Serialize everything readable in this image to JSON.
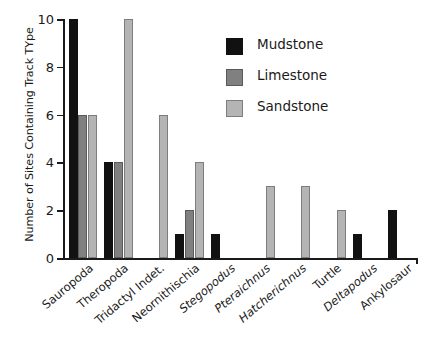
{
  "chart_data": {
    "type": "bar",
    "title": "",
    "xlabel": "",
    "ylabel": "Number of Sites Containing Track TYpe",
    "ylim": [
      0,
      10
    ],
    "yticks": [
      0,
      2,
      4,
      6,
      8,
      10
    ],
    "grid": false,
    "legend_position": "upper-right",
    "categories": [
      "Sauropoda",
      "Theropoda",
      "Tridactyl Indet.",
      "Neornithischia",
      "Stegopodus",
      "Pteraichnus",
      "Hatcherichnus",
      "Turtle",
      "Deltapodus",
      "Ankylosaur"
    ],
    "categories_italic": [
      false,
      false,
      false,
      false,
      true,
      true,
      true,
      false,
      true,
      false
    ],
    "series": [
      {
        "name": "Mudstone",
        "color": "#111111",
        "values": [
          10,
          4,
          0,
          1,
          1,
          0,
          0,
          0,
          1,
          2
        ]
      },
      {
        "name": "Limestone",
        "color": "#808080",
        "values": [
          6,
          4,
          0,
          2,
          0,
          0,
          0,
          0,
          0,
          0
        ]
      },
      {
        "name": "Sandstone",
        "color": "#b4b4b4",
        "values": [
          6,
          10,
          6,
          4,
          0,
          3,
          3,
          2,
          0,
          0
        ]
      }
    ]
  },
  "legend": {
    "items": [
      {
        "label": "Mudstone",
        "swatch": "mudstone"
      },
      {
        "label": "Limestone",
        "swatch": "limestone"
      },
      {
        "label": "Sandstone",
        "swatch": "sandstone"
      }
    ]
  },
  "axis": {
    "y_tick_labels": [
      "0",
      "2",
      "4",
      "6",
      "8",
      "10"
    ]
  }
}
